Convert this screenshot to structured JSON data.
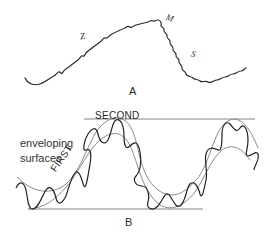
{
  "figure": {
    "panel_a": {
      "label": "A",
      "markers": [
        {
          "id": "z",
          "text": "Z"
        },
        {
          "id": "m",
          "text": "M"
        },
        {
          "id": "s",
          "text": "S"
        }
      ]
    },
    "panel_b": {
      "label": "B",
      "envelope_label_line1": "enveloping",
      "envelope_label_line2": "surfaces",
      "first_label": "FIRST",
      "second_label": "SECOND"
    },
    "colors": {
      "ink": "#2a2a2a",
      "envelope": "#8a8a8a",
      "background": "#ffffff"
    }
  }
}
